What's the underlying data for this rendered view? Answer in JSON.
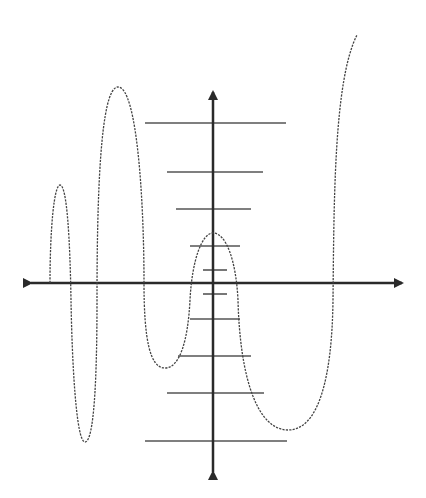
{
  "diagram": {
    "colors": {
      "background": "#ffffff",
      "axis": "#2a2a2a",
      "rung": "#555555",
      "curve": "#444444"
    },
    "axes": {
      "x_axis": {
        "y": 283,
        "x_start": 25,
        "x_end": 408,
        "arrows": "both"
      },
      "y_axis": {
        "x": 213,
        "y_start": 86,
        "y_end": 478,
        "arrows": "both"
      }
    },
    "rungs": [
      {
        "y": 123,
        "x1": 145,
        "x2": 286
      },
      {
        "y": 172,
        "x1": 167,
        "x2": 263
      },
      {
        "y": 209,
        "x1": 176,
        "x2": 251
      },
      {
        "y": 246,
        "x1": 190,
        "x2": 240
      },
      {
        "y": 270,
        "x1": 203,
        "x2": 227
      },
      {
        "y": 294,
        "x1": 203,
        "x2": 227
      },
      {
        "y": 319,
        "x1": 190,
        "x2": 240
      },
      {
        "y": 356,
        "x1": 178,
        "x2": 251
      },
      {
        "y": 393,
        "x1": 167,
        "x2": 264
      },
      {
        "y": 441,
        "x1": 145,
        "x2": 287
      }
    ],
    "curve": {
      "style": "dashed",
      "path": "M 50 283 C 50 230, 54 185, 60 185 C 67 185, 70 240, 71 300 C 72 360, 76 442, 85 442 C 94 442, 97 380, 97 300 C 97 200, 100 87, 118 87 C 137 87, 144 200, 144 283 C 144 340, 150 368, 165 368 C 180 368, 188 340, 190 300 C 192 260, 202 233, 213 233 C 226 233, 236 260, 238 300 C 240 380, 258 430, 288 430 C 318 430, 332 380, 333 300 C 334 200, 334 80, 357 35"
    }
  }
}
